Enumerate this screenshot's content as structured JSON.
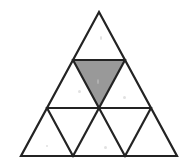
{
  "figure": {
    "name": "subdivided-equilateral-triangle",
    "description": "A large equilateral triangle divided by lines parallel to its sides into 9 congruent smaller equilateral triangles arranged in 3 rows; one inverted triangle in the middle row is shaded gray.",
    "background_color": "#ffffff",
    "stroke_color": "#232323",
    "stroke_width": 2.2,
    "shaded_fill": "#999999",
    "shaded_count": 1,
    "total_small_triangles": 9,
    "rows": 3,
    "row_counts": [
      1,
      3,
      5
    ],
    "outer_vertices": {
      "apex": {
        "x": 99,
        "y": 12
      },
      "bottom_left": {
        "x": 21,
        "y": 156
      },
      "bottom_right": {
        "x": 177,
        "y": 156
      }
    },
    "divider_lines": [
      {
        "name": "row-1-divider",
        "x1": 73,
        "y1": 60,
        "x2": 125,
        "y2": 60
      },
      {
        "name": "row-2-divider",
        "x1": 47,
        "y1": 108,
        "x2": 151,
        "y2": 108
      }
    ],
    "left_parallel_lines": [
      {
        "name": "left-parallel-a",
        "x1": 73,
        "y1": 60,
        "x2": 125,
        "y2": 156
      },
      {
        "name": "left-parallel-b",
        "x1": 47,
        "y1": 108,
        "x2": 73,
        "y2": 156
      }
    ],
    "right_parallel_lines": [
      {
        "name": "right-parallel-a",
        "x1": 125,
        "y1": 60,
        "x2": 73,
        "y2": 156
      },
      {
        "name": "right-parallel-b",
        "x1": 151,
        "y1": 108,
        "x2": 125,
        "y2": 156
      }
    ],
    "shaded_triangle": {
      "name": "shaded-inverted-triangle",
      "orientation": "inverted",
      "row": 2,
      "position_in_row": 2,
      "vertices": [
        {
          "x": 73,
          "y": 60
        },
        {
          "x": 125,
          "y": 60
        },
        {
          "x": 99,
          "y": 108
        }
      ],
      "fill": "#999999"
    },
    "small_triangles": [
      {
        "name": "row1-tri1",
        "row": 1,
        "index": 1,
        "orientation": "upright",
        "shaded": false
      },
      {
        "name": "row2-tri1",
        "row": 2,
        "index": 1,
        "orientation": "upright",
        "shaded": false
      },
      {
        "name": "row2-tri2",
        "row": 2,
        "index": 2,
        "orientation": "inverted",
        "shaded": true
      },
      {
        "name": "row2-tri3",
        "row": 2,
        "index": 3,
        "orientation": "upright",
        "shaded": false
      },
      {
        "name": "row3-tri1",
        "row": 3,
        "index": 1,
        "orientation": "upright",
        "shaded": false
      },
      {
        "name": "row3-tri2",
        "row": 3,
        "index": 2,
        "orientation": "inverted",
        "shaded": false
      },
      {
        "name": "row3-tri3",
        "row": 3,
        "index": 3,
        "orientation": "upright",
        "shaded": false
      },
      {
        "name": "row3-tri4",
        "row": 3,
        "index": 4,
        "orientation": "inverted",
        "shaded": false
      },
      {
        "name": "row3-tri5",
        "row": 3,
        "index": 5,
        "orientation": "upright",
        "shaded": false
      }
    ],
    "scan_specks": [
      {
        "x": 100,
        "y": 36,
        "w": 2,
        "h": 4
      },
      {
        "x": 97,
        "y": 79,
        "w": 2,
        "h": 5
      },
      {
        "x": 78,
        "y": 90,
        "w": 3,
        "h": 3
      },
      {
        "x": 123,
        "y": 96,
        "w": 3,
        "h": 3
      },
      {
        "x": 104,
        "y": 146,
        "w": 3,
        "h": 3
      },
      {
        "x": 46,
        "y": 145,
        "w": 2,
        "h": 2
      }
    ]
  }
}
